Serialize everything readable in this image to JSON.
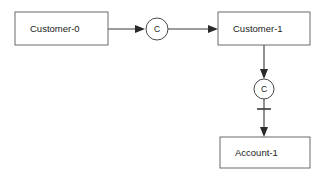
{
  "canvas": {
    "width": 329,
    "height": 177,
    "background_color": "#ffffff"
  },
  "diagram": {
    "type": "entity-relationship-diagram",
    "line_color": "#3a3a3a",
    "box_border_color": "#6b6b6b",
    "box_fill_color": "#ffffff",
    "text_color": "#1a1a1a"
  },
  "entities": [
    {
      "id": "customer-0",
      "label": "Customer-0",
      "x": 15,
      "y": 12,
      "width": 93,
      "height": 33,
      "text_x": 30,
      "text_y": 29
    },
    {
      "id": "customer-1",
      "label": "Customer-1",
      "x": 218,
      "y": 12,
      "width": 92,
      "height": 33,
      "text_x": 233,
      "text_y": 29
    },
    {
      "id": "account-1",
      "label": "Account-1",
      "x": 220,
      "y": 137,
      "width": 90,
      "height": 31,
      "text_x": 235,
      "text_y": 153
    }
  ],
  "relationships": [
    {
      "id": "relationship-c-horizontal",
      "label": "C",
      "cx": 157,
      "cy": 29,
      "r": 11
    },
    {
      "id": "relationship-c-vertical",
      "label": "C",
      "cx": 264,
      "cy": 89,
      "r": 10
    }
  ],
  "connectors": [
    {
      "id": "customer0-to-relationship",
      "from": "customer-0",
      "to": "relationship-c-horizontal",
      "orientation": "horizontal",
      "path": "M 108 29 L 143 29",
      "arrow_points": "135,25 145,29 135,33"
    },
    {
      "id": "relationship-to-customer1",
      "from": "relationship-c-horizontal",
      "to": "customer-1",
      "orientation": "horizontal",
      "path": "M 168 29 L 216 29",
      "arrow_points": "208,25 218,29 208,33"
    },
    {
      "id": "customer1-to-relationship-vertical",
      "from": "customer-1",
      "to": "relationship-c-vertical",
      "orientation": "vertical",
      "path": "M 264 45 L 264 77",
      "arrow_points": "260,69 264,79 268,69"
    },
    {
      "id": "relationship-to-account1",
      "from": "relationship-c-vertical",
      "to": "account-1",
      "orientation": "vertical",
      "path": "M 264 99 L 264 135",
      "arrow_points": "260,127 264,137 268,127"
    }
  ],
  "cardinality_marks": [
    {
      "id": "mandatory-one-tick",
      "notation": "single-tick",
      "x1": 257,
      "y1": 109,
      "x2": 271,
      "y2": 109
    }
  ]
}
